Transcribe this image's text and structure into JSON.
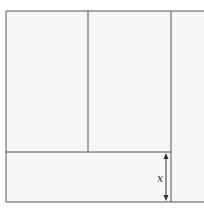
{
  "diagram": {
    "label": "x",
    "colors": {
      "line": "#555555",
      "fill": "#f7f7f7"
    }
  }
}
